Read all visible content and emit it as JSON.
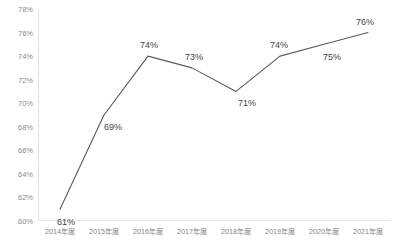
{
  "chart_data": {
    "type": "line",
    "title": "",
    "subtitle": "",
    "xlabel": "",
    "ylabel": "",
    "categories": [
      "2014年度",
      "2015年度",
      "2016年度",
      "2017年度",
      "2018年度",
      "2019年度",
      "2020年度",
      "2021年度"
    ],
    "values": [
      61,
      69,
      74,
      73,
      71,
      74,
      75,
      76
    ],
    "data_labels": [
      "61%",
      "69%",
      "74%",
      "73%",
      "71%",
      "74%",
      "75%",
      "76%"
    ],
    "ylim": [
      60,
      78
    ],
    "ytick_step": 2,
    "ytick_labels": [
      "78%",
      "76%",
      "74%",
      "72%",
      "70%",
      "68%",
      "66%",
      "64%",
      "62%",
      "60%"
    ],
    "ytick_values": [
      78,
      76,
      74,
      72,
      70,
      68,
      66,
      64,
      62,
      60
    ],
    "grid": false,
    "baseline_gridline": true,
    "legend": false,
    "legend_position": "none",
    "markers": false,
    "series": [
      {
        "name": "",
        "values": [
          61,
          69,
          74,
          73,
          71,
          74,
          75,
          76
        ],
        "color": "#595959"
      }
    ],
    "line_color": "#595959",
    "axis_color": "#e3e3e6",
    "tick_label_color": "#8a8a90",
    "data_label_color": "#3f3f44",
    "label_offsets": [
      {
        "dx": 6,
        "dy": 13
      },
      {
        "dx": 9,
        "dy": 12
      },
      {
        "dx": 1,
        "dy": -11
      },
      {
        "dx": 2,
        "dy": -11
      },
      {
        "dx": 11,
        "dy": 12
      },
      {
        "dx": -1,
        "dy": -11
      },
      {
        "dx": 8,
        "dy": 13
      },
      {
        "dx": -3,
        "dy": -11
      }
    ]
  }
}
